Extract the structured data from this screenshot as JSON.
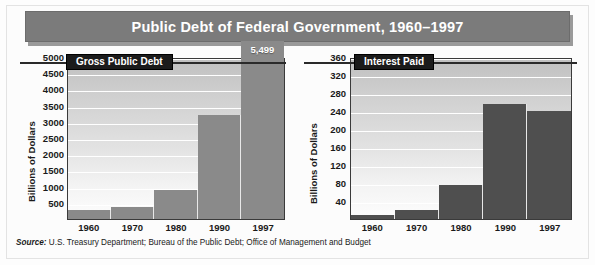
{
  "title": "Public Debt of Federal Government, 1960–1997",
  "source_prefix": "Source:",
  "source_text": " U.S. Treasury Department; Bureau of the Public Debt; Office of Management and  Budget",
  "colors": {
    "title_bar": "#7b7b7b",
    "title_shadow": "#9a9a9a",
    "debt_bar": "#8a8a8a",
    "interest_bar": "#4f4f4f",
    "badge_bg": "#1b1b1b",
    "axis": "#3a3a3a",
    "gridline": "#ffffff"
  },
  "charts": [
    {
      "badge": "Gross Public Debt",
      "ylabel": "Billions of Dollars",
      "ticks": [
        "5000",
        "4500",
        "4000",
        "3500",
        "3000",
        "2500",
        "2000",
        "1500",
        "1000",
        "500"
      ],
      "xlabels": [
        "1960",
        "1970",
        "1980",
        "1990",
        "1997"
      ],
      "value_label": "5,499"
    },
    {
      "badge": "Interest Paid",
      "ylabel": "Billions of Dollars",
      "ticks": [
        "360",
        "320",
        "280",
        "240",
        "200",
        "160",
        "120",
        "80",
        "40"
      ],
      "xlabels": [
        "1960",
        "1970",
        "1980",
        "1990",
        "1997"
      ],
      "value_label": ""
    }
  ],
  "chart_data": [
    {
      "type": "bar",
      "title": "Gross Public Debt",
      "xlabel": "",
      "ylabel": "Billions of Dollars",
      "categories": [
        "1960",
        "1970",
        "1980",
        "1990",
        "1997"
      ],
      "values": [
        291,
        381,
        909,
        3207,
        5499
      ],
      "ylim": [
        0,
        5000
      ],
      "ytick_values": [
        500,
        1000,
        1500,
        2000,
        2500,
        3000,
        3500,
        4000,
        4500,
        5000
      ],
      "grid": true,
      "legend": "none",
      "annotations": [
        {
          "category": "1997",
          "text": "5,499",
          "position": "above-bar-inside"
        }
      ],
      "notes": "1997 bar exceeds the 5000 axis maximum and is drawn overflowing above the plot frame."
    },
    {
      "type": "bar",
      "title": "Interest Paid",
      "xlabel": "",
      "ylabel": "Billions of Dollars",
      "categories": [
        "1960",
        "1970",
        "1980",
        "1990",
        "1997"
      ],
      "values": [
        9,
        19,
        75,
        255,
        240
      ],
      "ylim": [
        0,
        360
      ],
      "ytick_values": [
        40,
        80,
        120,
        160,
        200,
        240,
        280,
        320,
        360
      ],
      "grid": true,
      "legend": "none",
      "annotations": []
    }
  ]
}
